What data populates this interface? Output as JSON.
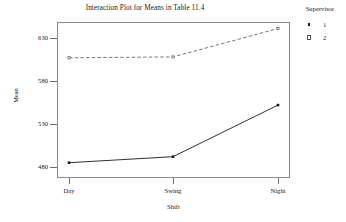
{
  "chart_data": {
    "type": "line",
    "title": "Interaction Plot for Means in Table 11.4",
    "xlabel": "Shift",
    "ylabel": "Mean",
    "categories": [
      "Day",
      "Swing",
      "Night"
    ],
    "ytick_labels": [
      "480",
      "530",
      "580",
      "630"
    ],
    "ytick_values": [
      480,
      530,
      580,
      630
    ],
    "ylim": [
      468,
      652
    ],
    "grid": false,
    "legend_position": "right",
    "legend_title": "Supervisor",
    "series": [
      {
        "name": "1",
        "style": "solid",
        "marker": "filled-square",
        "color": "#1a1a1a",
        "values": [
          485,
          492,
          552
        ]
      },
      {
        "name": "2",
        "style": "dashed",
        "marker": "open-square",
        "color": "#555555",
        "values": [
          607,
          608,
          641
        ]
      }
    ]
  },
  "legend": {
    "title": "Supervisor",
    "entries": [
      {
        "label": "1"
      },
      {
        "label": "2"
      }
    ]
  },
  "axes": {
    "y_title": "Mean",
    "x_title": "Shift",
    "y_ticks": [
      {
        "label": "630",
        "top": 38
      },
      {
        "label": "580",
        "top": 81
      },
      {
        "label": "530",
        "top": 124
      },
      {
        "label": "480",
        "top": 167
      }
    ],
    "x_ticks": [
      {
        "label": "Day",
        "left": 69
      },
      {
        "label": "Swing",
        "left": 173
      },
      {
        "label": "Night",
        "left": 278
      }
    ]
  },
  "title": "Interaction Plot for Means in Table 11.4",
  "colors": {
    "frame": "#8d8d8d",
    "series1": "#1a1a1a",
    "series2": "#555555",
    "text": "#1a1a1a",
    "background": "#ffffff"
  }
}
